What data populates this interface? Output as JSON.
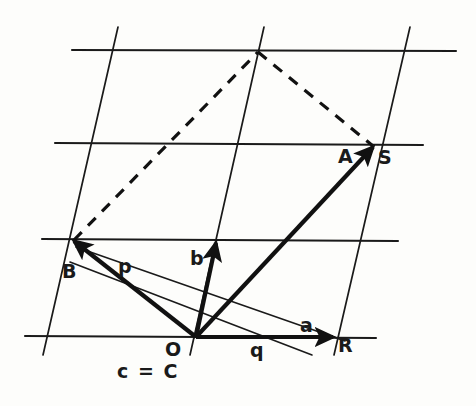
{
  "figure": {
    "background_color": "#fdfdfb",
    "ink_color": "#111111",
    "labels": [
      {
        "name": "label-point-A",
        "text": "A",
        "x": 338,
        "y": 147,
        "kind": "point"
      },
      {
        "name": "label-point-S",
        "text": "S",
        "x": 378,
        "y": 148,
        "kind": "point"
      },
      {
        "name": "label-point-B",
        "text": "B",
        "x": 62,
        "y": 262,
        "kind": "point"
      },
      {
        "name": "label-point-O",
        "text": "O",
        "x": 165,
        "y": 340,
        "kind": "point"
      },
      {
        "name": "label-point-R",
        "text": "R",
        "x": 338,
        "y": 336,
        "kind": "point"
      },
      {
        "name": "label-vector-a",
        "text": "a",
        "x": 300,
        "y": 316,
        "kind": "vector"
      },
      {
        "name": "label-vector-b",
        "text": "b",
        "x": 190,
        "y": 249,
        "kind": "vector"
      },
      {
        "name": "label-line-p",
        "text": "p",
        "x": 118,
        "y": 257,
        "kind": "line"
      },
      {
        "name": "label-line-q",
        "text": "q",
        "x": 250,
        "y": 341,
        "kind": "line"
      },
      {
        "name": "label-equation-c",
        "text": "c = C",
        "x": 117,
        "y": 362,
        "kind": "equation"
      }
    ],
    "lattice": {
      "horizontal_lines": [
        {
          "name": "lattice-row-1",
          "x1": 72,
          "y1": 50,
          "x2": 456,
          "y2": 51
        },
        {
          "name": "lattice-row-2",
          "x1": 55,
          "y1": 143,
          "x2": 423,
          "y2": 145
        },
        {
          "name": "lattice-row-3",
          "x1": 42,
          "y1": 239,
          "x2": 398,
          "y2": 241
        },
        {
          "name": "lattice-row-4",
          "x1": 25,
          "y1": 336,
          "x2": 376,
          "y2": 338
        }
      ],
      "slanted_lines": [
        {
          "name": "lattice-col-1",
          "x1": 118,
          "y1": 27,
          "x2": 43,
          "y2": 355
        },
        {
          "name": "lattice-col-2",
          "x1": 264,
          "y1": 27,
          "x2": 190,
          "y2": 355
        },
        {
          "name": "lattice-col-3",
          "x1": 410,
          "y1": 27,
          "x2": 334,
          "y2": 355
        }
      ]
    },
    "vectors": [
      {
        "name": "vector-OR-a",
        "label": "a",
        "x1": 196,
        "y1": 337,
        "x2": 333,
        "y2": 337
      },
      {
        "name": "vector-Ob-b",
        "label": "b",
        "x1": 196,
        "y1": 337,
        "x2": 216,
        "y2": 243
      },
      {
        "name": "vector-OB",
        "label": "B",
        "x1": 196,
        "y1": 337,
        "x2": 74,
        "y2": 241
      },
      {
        "name": "vector-OS",
        "label": "S",
        "x1": 196,
        "y1": 337,
        "x2": 373,
        "y2": 147
      }
    ],
    "dashed_lines": [
      {
        "name": "dashed-B-to-apex",
        "x1": 74,
        "y1": 240,
        "x2": 258,
        "y2": 52
      },
      {
        "name": "dashed-apex-to-S",
        "x1": 258,
        "y1": 52,
        "x2": 373,
        "y2": 146
      }
    ],
    "thin_lines": [
      {
        "name": "line-p-through-O",
        "label": "p",
        "x1": 76,
        "y1": 247,
        "x2": 345,
        "y2": 341
      },
      {
        "name": "line-q-through-O",
        "label": "q",
        "x1": 70,
        "y1": 262,
        "x2": 312,
        "y2": 355
      }
    ],
    "points": [
      {
        "name": "point-O-origin",
        "x": 196,
        "y": 337
      },
      {
        "name": "point-B",
        "x": 74,
        "y": 240
      },
      {
        "name": "point-S",
        "x": 373,
        "y": 146
      },
      {
        "name": "point-R",
        "x": 333,
        "y": 337
      },
      {
        "name": "point-apex",
        "x": 258,
        "y": 52
      }
    ]
  }
}
